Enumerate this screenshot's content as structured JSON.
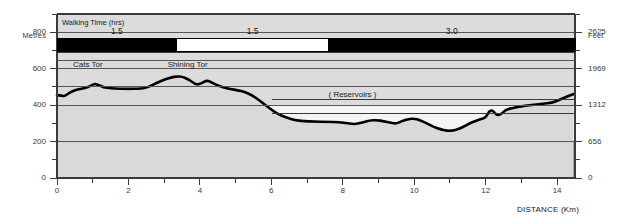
{
  "chart_data": {
    "type": "area",
    "title": "",
    "xlabel": "DISTANCE (Km)",
    "ylabel_left": "Metres",
    "ylabel_right": "Feet",
    "xlim": [
      0,
      14.5
    ],
    "ylim": [
      0,
      900
    ],
    "grid": true,
    "legend": "none",
    "x_ticks_major": [
      0,
      2,
      4,
      6,
      8,
      10,
      12,
      14
    ],
    "x_ticks_minor": [
      1,
      3,
      5,
      7,
      9,
      11,
      13
    ],
    "x_tick_labels": [
      "0",
      "2",
      "4",
      "6",
      "8",
      "10",
      "12",
      "14"
    ],
    "y_left_ticks": [
      0,
      200,
      400,
      600,
      800
    ],
    "y_left_tick_labels": [
      "0",
      "200",
      "400",
      "600",
      "800"
    ],
    "y_left_minor_ticks": [
      100,
      300,
      500,
      700,
      900
    ],
    "y_right_ticks": [
      0,
      200,
      400,
      600,
      800
    ],
    "y_right_tick_labels": [
      "0",
      "656",
      "1312",
      "1969",
      "2625"
    ],
    "gridlines_metres": [
      200,
      400,
      500,
      600,
      700,
      800
    ],
    "band_shading": [
      {
        "from": 0,
        "to": 200,
        "color": "#999999",
        "name": "lowland-band"
      },
      {
        "from": 200,
        "to": 400,
        "color": "#f4f4f4",
        "name": "mid-band"
      },
      {
        "from": 400,
        "to": 900,
        "color": "#dcdcdc",
        "name": "upland-band"
      }
    ],
    "series": [
      {
        "name": "Elevation profile",
        "line_color": "#000000",
        "fill_color": "#d9d9d9",
        "points": [
          [
            0.0,
            455
          ],
          [
            0.12,
            452
          ],
          [
            0.22,
            448
          ],
          [
            0.35,
            470
          ],
          [
            0.55,
            485
          ],
          [
            0.75,
            492
          ],
          [
            0.95,
            505
          ],
          [
            1.05,
            518
          ],
          [
            1.15,
            512
          ],
          [
            1.3,
            498
          ],
          [
            1.5,
            492
          ],
          [
            1.75,
            490
          ],
          [
            2.0,
            489
          ],
          [
            2.25,
            490
          ],
          [
            2.45,
            492
          ],
          [
            2.62,
            505
          ],
          [
            2.8,
            522
          ],
          [
            3.0,
            540
          ],
          [
            3.2,
            552
          ],
          [
            3.35,
            558
          ],
          [
            3.5,
            556
          ],
          [
            3.65,
            545
          ],
          [
            3.8,
            525
          ],
          [
            3.92,
            512
          ],
          [
            4.05,
            520
          ],
          [
            4.18,
            535
          ],
          [
            4.28,
            530
          ],
          [
            4.45,
            512
          ],
          [
            4.65,
            498
          ],
          [
            4.85,
            488
          ],
          [
            5.05,
            482
          ],
          [
            5.25,
            472
          ],
          [
            5.45,
            455
          ],
          [
            5.65,
            428
          ],
          [
            5.85,
            398
          ],
          [
            6.05,
            368
          ],
          [
            6.25,
            345
          ],
          [
            6.45,
            330
          ],
          [
            6.65,
            318
          ],
          [
            6.9,
            312
          ],
          [
            7.2,
            310
          ],
          [
            7.55,
            308
          ],
          [
            7.9,
            306
          ],
          [
            8.15,
            300
          ],
          [
            8.35,
            295
          ],
          [
            8.55,
            305
          ],
          [
            8.75,
            316
          ],
          [
            8.95,
            318
          ],
          [
            9.15,
            312
          ],
          [
            9.35,
            302
          ],
          [
            9.5,
            298
          ],
          [
            9.65,
            312
          ],
          [
            9.85,
            324
          ],
          [
            10.0,
            326
          ],
          [
            10.15,
            318
          ],
          [
            10.35,
            300
          ],
          [
            10.55,
            280
          ],
          [
            10.75,
            266
          ],
          [
            10.95,
            258
          ],
          [
            11.15,
            262
          ],
          [
            11.35,
            278
          ],
          [
            11.55,
            300
          ],
          [
            11.7,
            312
          ],
          [
            11.85,
            322
          ],
          [
            12.0,
            330
          ],
          [
            12.1,
            368
          ],
          [
            12.2,
            372
          ],
          [
            12.3,
            345
          ],
          [
            12.42,
            348
          ],
          [
            12.55,
            372
          ],
          [
            12.7,
            382
          ],
          [
            12.9,
            390
          ],
          [
            13.1,
            396
          ],
          [
            13.35,
            402
          ],
          [
            13.6,
            408
          ],
          [
            13.85,
            412
          ],
          [
            14.05,
            428
          ],
          [
            14.25,
            445
          ],
          [
            14.45,
            460
          ]
        ]
      }
    ],
    "annotations": [
      {
        "name": "cats-tor",
        "text": "Cats Tor",
        "x_km": 0.95,
        "label_km": 0.45,
        "metres_label_band": 620
      },
      {
        "name": "shining-tor",
        "text": "Shining Tor",
        "x_km": 3.35,
        "label_km": 3.1,
        "metres_label_band": 620
      },
      {
        "name": "reservoirs",
        "text": "( Reservoirs )",
        "x_km": 7.6,
        "label_km": 7.6,
        "metres_label_band": 455
      }
    ]
  },
  "walking_time": {
    "title": "Walking Time (hrs)",
    "segments": [
      {
        "label": "1.5",
        "fill": "black",
        "start_km": 0.0,
        "end_km": 3.35
      },
      {
        "label": "1.5",
        "fill": "white",
        "start_km": 3.35,
        "end_km": 7.6
      },
      {
        "label": "3.0",
        "fill": "black",
        "start_km": 7.6,
        "end_km": 14.5
      }
    ]
  },
  "axes": {
    "left_title": "Metres",
    "right_title": "Feet",
    "bottom_title": "DISTANCE (Km)"
  },
  "colors": {
    "line": "#000000",
    "profile_fill": "#d9d9d9",
    "lowland_band": "#999999",
    "mid_band": "#f4f4f4",
    "upland_band": "#dcdcdc",
    "gridline": "#555555",
    "frame": "#3a3a3a",
    "text": "#2a2a2a",
    "background": "#ffffff"
  }
}
